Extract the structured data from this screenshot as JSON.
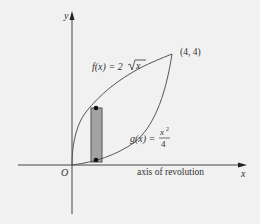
{
  "figure": {
    "colors": {
      "background": "#f1f1f1",
      "curve": "#555555",
      "axis": "#444444",
      "rectangle_fill": "#a3a3a3",
      "rectangle_stroke": "#555555",
      "text": "#333333"
    },
    "axes": {
      "x_label": "x",
      "y_label": "y",
      "origin_label": "O",
      "axis_annotation": "axis of revolution"
    },
    "curves": [
      {
        "name": "f",
        "label_prefix": "f(x) = 2",
        "label_radicand": "x",
        "expression": "2√x"
      },
      {
        "name": "g",
        "label_prefix": "g(x) = ",
        "label_numerator": "x",
        "label_exponent": "2",
        "label_denominator": "4",
        "expression": "x²/4"
      }
    ],
    "intersection_point": {
      "label": "(4, 4)",
      "x": 4,
      "y": 4
    },
    "representative_rectangle": {
      "x": 0.95,
      "description": "vertical strip between g and f"
    }
  }
}
